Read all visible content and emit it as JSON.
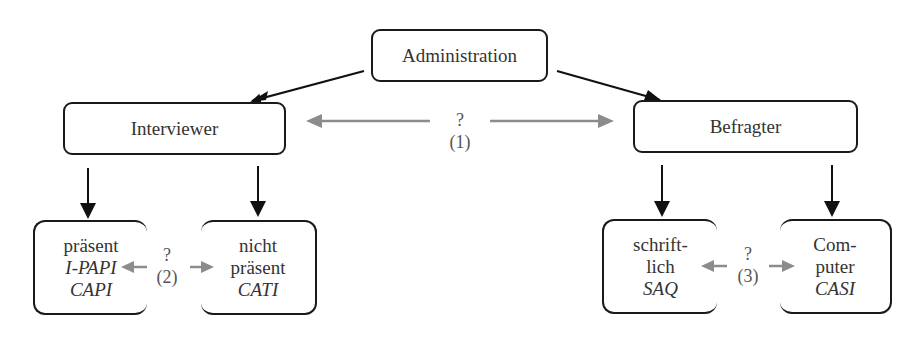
{
  "diagram": {
    "root": {
      "label": "Administration"
    },
    "level1": [
      {
        "id": "interviewer",
        "label": "Interviewer"
      },
      {
        "id": "befragter",
        "label": "Befragter"
      }
    ],
    "connector1": {
      "question": "?",
      "number": "(1)"
    },
    "interviewer_children": [
      {
        "lines": [
          "präsent"
        ],
        "italic_lines": [
          "I-PAPI",
          "CAPI"
        ]
      },
      {
        "lines": [
          "nicht",
          "präsent"
        ],
        "italic_lines": [
          "CATI"
        ]
      }
    ],
    "connector2": {
      "question": "?",
      "number": "(2)"
    },
    "befragter_children": [
      {
        "lines": [
          "schrift-",
          "lich"
        ],
        "italic_lines": [
          "SAQ"
        ]
      },
      {
        "lines": [
          "Com-",
          "puter"
        ],
        "italic_lines": [
          "CASI"
        ]
      }
    ],
    "connector3": {
      "question": "?",
      "number": "(3)"
    },
    "colors": {
      "box_border": "#1a1a1a",
      "hierarchy_arrow": "#111111",
      "question_arrow": "#8c8c8c",
      "text": "#333333"
    }
  }
}
